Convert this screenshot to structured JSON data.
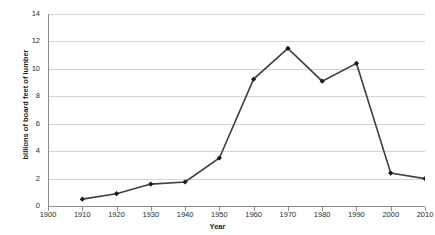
{
  "chart_data": {
    "type": "line",
    "title": "",
    "xlabel": "Year",
    "ylabel": "billions of board feet of lumber",
    "x": [
      1910,
      1920,
      1930,
      1940,
      1950,
      1960,
      1970,
      1980,
      1990,
      2000,
      2010
    ],
    "values": [
      0.5,
      0.9,
      1.6,
      1.75,
      3.5,
      9.25,
      11.5,
      9.1,
      10.4,
      2.4,
      2.0
    ],
    "series": [
      {
        "name": "lumber",
        "values": [
          0.5,
          0.9,
          1.6,
          1.75,
          3.5,
          9.25,
          11.5,
          9.1,
          10.4,
          2.4,
          2.0
        ]
      }
    ],
    "xlim": [
      1900,
      2010
    ],
    "ylim": [
      0,
      14
    ],
    "xticks": [
      1900,
      1910,
      1920,
      1930,
      1940,
      1950,
      1960,
      1970,
      1980,
      1990,
      2000,
      2010
    ],
    "yticks": [
      0,
      2,
      4,
      6,
      8,
      10,
      12,
      14
    ],
    "xtick_labels": [
      "1900",
      "1910",
      "1920",
      "1930",
      "1940",
      "1950",
      "1960",
      "1970",
      "1980",
      "1990",
      "2000",
      "2010"
    ],
    "ytick_labels": [
      "0",
      "2",
      "4",
      "6",
      "8",
      "10",
      "12",
      "14"
    ],
    "grid": "horizontal",
    "legend": "none",
    "line_color": "#404040",
    "marker": "diamond",
    "marker_color": "#1a1a1a",
    "grid_color": "#d4d4d4",
    "axis_color": "#8c8c8c",
    "background": "#ffffff"
  }
}
